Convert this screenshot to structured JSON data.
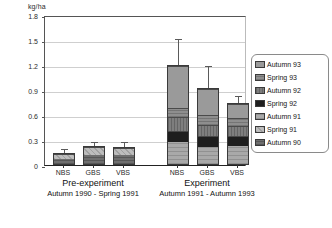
{
  "chart_data": {
    "type": "bar",
    "subtype": "stacked-bar-with-error-bars",
    "title": "",
    "ylabel": "kg/ha",
    "xlabel": "",
    "ylim": [
      0,
      1.8
    ],
    "yticks": [
      0,
      0.3,
      0.6,
      0.9,
      1.2,
      1.5,
      1.8
    ],
    "ytick_labels": [
      "0",
      "0.3",
      "0.6",
      "0.9",
      "1.2",
      "1.5",
      "1.8"
    ],
    "grid": true,
    "legend_position": "right",
    "categories": [
      "NBS",
      "GBS",
      "VBS",
      "NBS",
      "GBS",
      "VBS"
    ],
    "groups": [
      {
        "name": "Pre-experiment",
        "period": "Autumn 1990 - Spring 1991",
        "categories": [
          "NBS",
          "GBS",
          "VBS"
        ]
      },
      {
        "name": "Experiment",
        "period": "Autumn 1991 - Autumn 1993",
        "categories": [
          "NBS",
          "GBS",
          "VBS"
        ]
      }
    ],
    "series": [
      {
        "name": "Autumn 93",
        "color": "#9a9a9a",
        "fill": "f-a93",
        "values": [
          0.0,
          0.0,
          0.0,
          0.52,
          0.32,
          0.18
        ]
      },
      {
        "name": "Spring 93",
        "color": "#8e8e8e",
        "fill": "f-s93",
        "values": [
          0.0,
          0.0,
          0.0,
          0.1,
          0.12,
          0.1
        ]
      },
      {
        "name": "Autumn 92",
        "color": "#7e7e7e",
        "fill": "f-a92",
        "values": [
          0.0,
          0.0,
          0.0,
          0.17,
          0.14,
          0.12
        ]
      },
      {
        "name": "Spring 92",
        "color": "#1e1e1e",
        "fill": "f-s92",
        "values": [
          0.0,
          0.0,
          0.0,
          0.14,
          0.13,
          0.12
        ]
      },
      {
        "name": "Autumn 91",
        "color": "#a9a9a9",
        "fill": "f-a91",
        "values": [
          0.0,
          0.0,
          0.0,
          0.27,
          0.21,
          0.23
        ]
      },
      {
        "name": "Spring 91",
        "color": "#bdbdbd",
        "fill": "f-s91",
        "values": [
          0.07,
          0.11,
          0.1,
          0.0,
          0.0,
          0.0
        ]
      },
      {
        "name": "Autumn 90",
        "color": "#6f6f6f",
        "fill": "f-a90",
        "values": [
          0.08,
          0.12,
          0.12,
          0.0,
          0.0,
          0.0
        ]
      }
    ],
    "totals": [
      0.15,
      0.23,
      0.22,
      1.2,
      0.92,
      0.75
    ],
    "error_upper": [
      0.18,
      0.27,
      0.26,
      1.5,
      1.18,
      0.82
    ]
  },
  "legend": {
    "items": [
      {
        "label": "Autumn 93",
        "fill": "f-a93"
      },
      {
        "label": "Spring 93",
        "fill": "f-s93"
      },
      {
        "label": "Autumn 92",
        "fill": "f-a92"
      },
      {
        "label": "Spring 92",
        "fill": "f-s92"
      },
      {
        "label": "Autumn 91",
        "fill": "f-a91"
      },
      {
        "label": "Spring 91",
        "fill": "f-s91"
      },
      {
        "label": "Autumn 90",
        "fill": "f-a90"
      }
    ]
  }
}
